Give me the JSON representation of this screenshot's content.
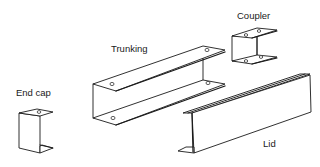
{
  "diagram": {
    "line_color": "#1a1a1a",
    "background": "#ffffff",
    "components": [
      {
        "id": "trunking",
        "label": "Trunking"
      },
      {
        "id": "coupler",
        "label": "Coupler"
      },
      {
        "id": "end-cap",
        "label": "End cap"
      },
      {
        "id": "lid",
        "label": "Lid"
      }
    ]
  }
}
